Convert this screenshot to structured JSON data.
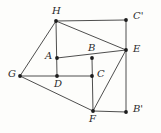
{
  "figure": {
    "width": 161,
    "height": 133,
    "background_color": "#fdfdfb",
    "stroke_color": "#3a3a3a",
    "dot_color": "#1c1c1c",
    "label_color": "#2b2b2b",
    "stroke_width": 0.9,
    "dot_radius": 1.9
  },
  "points": [
    {
      "id": "H",
      "label": "H",
      "x": 56,
      "y": 21,
      "label_x": 52,
      "label_y": 6
    },
    {
      "id": "Cp",
      "label": "C'",
      "x": 126,
      "y": 20,
      "label_x": 133,
      "label_y": 11
    },
    {
      "id": "A",
      "label": "A",
      "x": 57,
      "y": 58,
      "label_x": 45,
      "label_y": 51
    },
    {
      "id": "B",
      "label": "B",
      "x": 92,
      "y": 58,
      "label_x": 88,
      "label_y": 43
    },
    {
      "id": "E",
      "label": "E",
      "x": 126,
      "y": 50,
      "label_x": 133,
      "label_y": 44
    },
    {
      "id": "G",
      "label": "G",
      "x": 20,
      "y": 76,
      "label_x": 8,
      "label_y": 69
    },
    {
      "id": "D",
      "label": "D",
      "x": 57,
      "y": 76,
      "label_x": 54,
      "label_y": 79
    },
    {
      "id": "C",
      "label": "C",
      "x": 92,
      "y": 76,
      "label_x": 97,
      "label_y": 69
    },
    {
      "id": "F",
      "label": "F",
      "x": 93,
      "y": 111,
      "label_x": 89,
      "label_y": 114
    },
    {
      "id": "Bp",
      "label": "B'",
      "x": 126,
      "y": 112,
      "label_x": 133,
      "label_y": 104
    }
  ],
  "edges": [
    {
      "name": "edge-H-Cprime",
      "from": "H",
      "to": "Cp"
    },
    {
      "name": "edge-Cprime-E",
      "from": "Cp",
      "to": "E"
    },
    {
      "name": "edge-H-E",
      "from": "H",
      "to": "E"
    },
    {
      "name": "edge-H-G",
      "from": "H",
      "to": "G"
    },
    {
      "name": "edge-H-D",
      "from": "H",
      "to": "D"
    },
    {
      "name": "edge-G-D",
      "from": "G",
      "to": "D"
    },
    {
      "name": "edge-D-C",
      "from": "D",
      "to": "C"
    },
    {
      "name": "edge-A-E",
      "from": "A",
      "to": "E"
    },
    {
      "name": "edge-B-F",
      "from": "B",
      "to": "F"
    },
    {
      "name": "edge-E-F",
      "from": "E",
      "to": "F"
    },
    {
      "name": "edge-E-Bprime",
      "from": "E",
      "to": "Bp"
    },
    {
      "name": "edge-F-Bprime",
      "from": "F",
      "to": "Bp"
    },
    {
      "name": "edge-G-F",
      "from": "G",
      "to": "F"
    }
  ]
}
